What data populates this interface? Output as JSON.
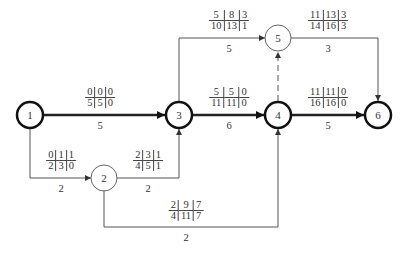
{
  "diagram": {
    "type": "activity-on-arrow network (CPM)",
    "label_format": "ES|LS|TF over EF|LF|FF",
    "nodes": [
      {
        "id": "1",
        "label": "1",
        "x": 30,
        "y": 115,
        "critical": true
      },
      {
        "id": "2",
        "label": "2",
        "x": 104,
        "y": 178,
        "critical": false
      },
      {
        "id": "3",
        "label": "3",
        "x": 179,
        "y": 115,
        "critical": true
      },
      {
        "id": "4",
        "label": "4",
        "x": 278,
        "y": 115,
        "critical": true
      },
      {
        "id": "5",
        "label": "5",
        "x": 278,
        "y": 38,
        "critical": false
      },
      {
        "id": "6",
        "label": "6",
        "x": 378,
        "y": 115,
        "critical": true
      }
    ],
    "edges": [
      {
        "from": "1",
        "to": "3",
        "duration": "5",
        "critical": true,
        "top": [
          "0",
          "0",
          "0"
        ],
        "bottom": [
          "5",
          "5",
          "0"
        ]
      },
      {
        "from": "1",
        "to": "2",
        "duration": "2",
        "critical": false,
        "top": [
          "0",
          "1",
          "1"
        ],
        "bottom": [
          "2",
          "3",
          "0"
        ]
      },
      {
        "from": "2",
        "to": "3",
        "duration": "2",
        "critical": false,
        "top": [
          "2",
          "3",
          "1"
        ],
        "bottom": [
          "4",
          "5",
          "1"
        ]
      },
      {
        "from": "2",
        "to": "4",
        "duration": "2",
        "critical": false,
        "top": [
          "2",
          "9",
          "7"
        ],
        "bottom": [
          "4",
          "11",
          "7"
        ]
      },
      {
        "from": "3",
        "to": "4",
        "duration": "6",
        "critical": true,
        "top": [
          "5",
          "5",
          "0"
        ],
        "bottom": [
          "11",
          "11",
          "0"
        ]
      },
      {
        "from": "3",
        "to": "5",
        "duration": "5",
        "critical": false,
        "top": [
          "5",
          "8",
          "3"
        ],
        "bottom": [
          "10",
          "13",
          "1"
        ]
      },
      {
        "from": "4",
        "to": "5",
        "duration": "",
        "critical": false,
        "dummy": true
      },
      {
        "from": "5",
        "to": "6",
        "duration": "3",
        "critical": false,
        "top": [
          "11",
          "13",
          "3"
        ],
        "bottom": [
          "14",
          "16",
          "3"
        ]
      },
      {
        "from": "4",
        "to": "6",
        "duration": "5",
        "critical": true,
        "top": [
          "11",
          "11",
          "0"
        ],
        "bottom": [
          "16",
          "16",
          "0"
        ]
      }
    ]
  },
  "labels": {
    "e13": {
      "dur": "5",
      "t": [
        "0",
        "0",
        "0"
      ],
      "b": [
        "5",
        "5",
        "0"
      ]
    },
    "e12": {
      "dur": "2",
      "t": [
        "0",
        "1",
        "1"
      ],
      "b": [
        "2",
        "3",
        "0"
      ]
    },
    "e23": {
      "dur": "2",
      "t": [
        "2",
        "3",
        "1"
      ],
      "b": [
        "4",
        "5",
        "1"
      ]
    },
    "e24": {
      "dur": "2",
      "t": [
        "2",
        "9",
        "7"
      ],
      "b": [
        "4",
        "11",
        "7"
      ]
    },
    "e34": {
      "dur": "6",
      "t": [
        "5",
        "5",
        "0"
      ],
      "b": [
        "11",
        "11",
        "0"
      ]
    },
    "e35": {
      "dur": "5",
      "t": [
        "5",
        "8",
        "3"
      ],
      "b": [
        "10",
        "13",
        "1"
      ]
    },
    "e56": {
      "dur": "3",
      "t": [
        "11",
        "13",
        "3"
      ],
      "b": [
        "14",
        "16",
        "3"
      ]
    },
    "e46": {
      "dur": "5",
      "t": [
        "11",
        "11",
        "0"
      ],
      "b": [
        "16",
        "16",
        "0"
      ]
    }
  },
  "node_labels": {
    "n1": "1",
    "n2": "2",
    "n3": "3",
    "n4": "4",
    "n5": "5",
    "n6": "6"
  },
  "colors": {
    "line": "#555555",
    "critical_line": "#222222",
    "text": "#333333",
    "background": "#ffffff"
  }
}
